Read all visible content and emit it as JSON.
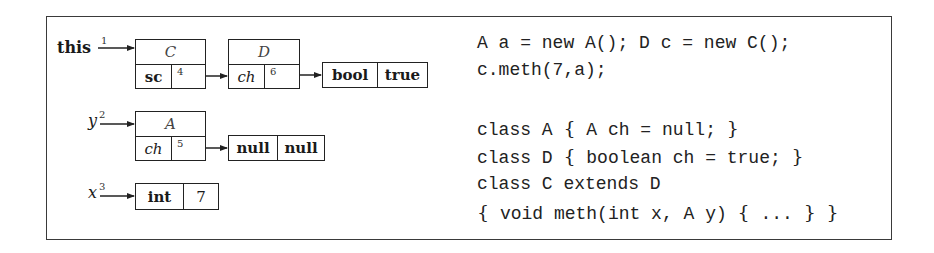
{
  "diagram": {
    "frame_color": "#3a3a3a",
    "references": [
      {
        "name": "this",
        "label": "this",
        "index": "1",
        "style": "bold"
      },
      {
        "name": "y",
        "label": "y",
        "index": "2",
        "style": "italic"
      },
      {
        "name": "x",
        "label": "x",
        "index": "3",
        "style": "italic"
      }
    ],
    "objects": {
      "c_object": {
        "class_name": "C",
        "field_name": "sc",
        "field_ref": "4"
      },
      "d_object": {
        "class_name": "D",
        "field_name": "ch",
        "field_ref": "6"
      },
      "bool_value": {
        "type": "bool",
        "value": "true"
      },
      "a_object": {
        "class_name": "A",
        "field_name": "ch",
        "field_ref": "5"
      },
      "null_value": {
        "type": "null",
        "value": "null"
      },
      "int_value": {
        "type": "int",
        "value": "7"
      }
    }
  },
  "code": {
    "lines": [
      "A a = new A(); D c = new C();",
      "c.meth(7,a);",
      "",
      "class A { A ch = null; }",
      "class D { boolean ch = true; }",
      "class C extends D",
      "{ void meth(int x, A y) { ... } }"
    ],
    "segments": {
      "l1": "A a = new A(); D c = new C();",
      "l2": "c.meth(7,a);",
      "l3a": "class A ",
      "l3b": "{",
      "l3c": " A ch = null; ",
      "l3d": "}",
      "l4a": "class D ",
      "l4b": "{",
      "l4c": " boolean ch = true; ",
      "l4d": "}",
      "l5": "class C extends D",
      "l6a": "{",
      "l6b": " void meth(int x, A y) ",
      "l6c": "{",
      "l6d": " ... ",
      "l6e": "}",
      "l6f": " ",
      "l6g": "}"
    }
  }
}
